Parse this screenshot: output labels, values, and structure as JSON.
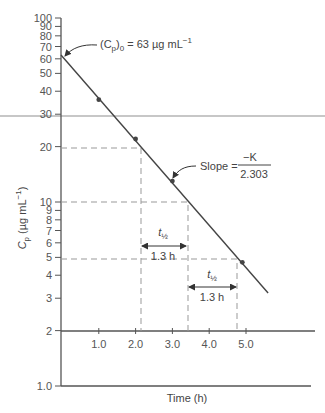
{
  "chart_data": {
    "type": "line",
    "title": "",
    "xlabel": "Time (h)",
    "ylabel": "Cp (µg mL⁻¹)",
    "ylabel_parts": {
      "main": "C",
      "sub": "p",
      "units": " (µg mL",
      "sup": "−1",
      "close": ")"
    },
    "yscale": "log",
    "ylim": [
      1.0,
      100
    ],
    "xlim": [
      0,
      6.7
    ],
    "x_ticks": [
      "1.0",
      "2.0",
      "3.0",
      "4.0",
      "5.0"
    ],
    "x_tick_values": [
      1,
      2,
      3,
      4,
      5
    ],
    "y_ticks": [
      "100",
      "90",
      "80",
      "70",
      "60",
      "50",
      "40",
      "30",
      "20",
      "10",
      "9",
      "8",
      "7",
      "6",
      "5",
      "4",
      "3",
      "2",
      "1.0"
    ],
    "y_tick_values": [
      100,
      90,
      80,
      70,
      60,
      50,
      40,
      30,
      20,
      10,
      9,
      8,
      7,
      6,
      5,
      4,
      3,
      2,
      1
    ],
    "series": [
      {
        "name": "Cp",
        "x": [
          1.0,
          2.0,
          3.0,
          4.9
        ],
        "values": [
          36,
          22,
          13,
          4.7
        ]
      }
    ],
    "fit_line": {
      "x": [
        0,
        5.6
      ],
      "values": [
        63,
        3.2
      ]
    },
    "grid": false,
    "legend": null,
    "annotations": {
      "c0": {
        "prefix": "(C",
        "sub": "p",
        "close": ")",
        "sub0": "0",
        "text": " = 63 µg mL",
        "sup": "−1"
      },
      "slope": {
        "label": "Slope =",
        "numerator": "−K",
        "denominator": "2.303"
      },
      "half_life_1": {
        "symbol": "t",
        "sub": "½",
        "value": "1.3 h",
        "from_conc": 20,
        "to_conc": 10
      },
      "half_life_2": {
        "symbol": "t",
        "sub": "½",
        "value": "1.3 h",
        "from_conc": 10,
        "to_conc": 5
      }
    }
  }
}
